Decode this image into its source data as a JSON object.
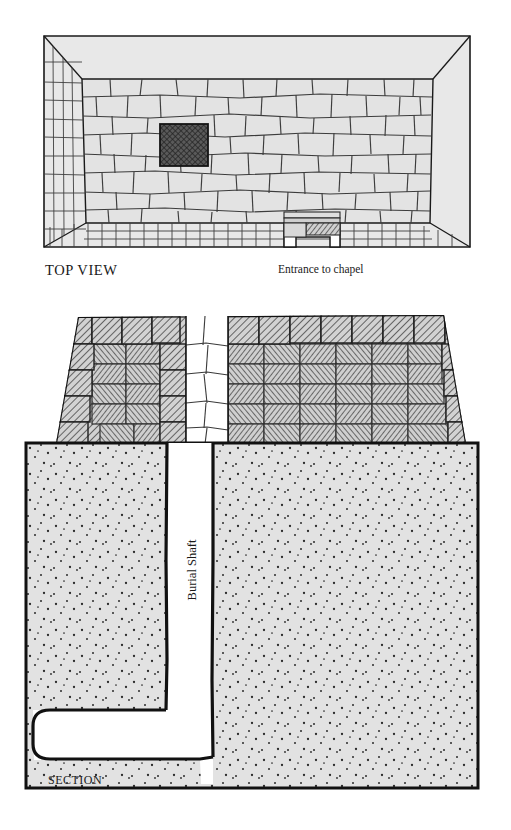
{
  "figure": {
    "kind": "archaeological-diagram",
    "panels": [
      {
        "id": "top-view",
        "label": "TOP VIEW"
      },
      {
        "id": "section",
        "label": "SECTION"
      }
    ]
  },
  "labels": {
    "top_view": "TOP VIEW",
    "entrance_to_chapel": "Entrance to chapel",
    "burial_shaft": "Burial Shaft",
    "section": "SECTION"
  },
  "colors": {
    "paper": "#ffffff",
    "ink": "#1a1a1a",
    "wall_face_fill": "#e8e8e8",
    "stone_fill": "#e3e3e3",
    "stone_stroke": "#4a4a4a",
    "bedrock_fill": "#e2e2e2",
    "bedrock_stipple": "#2b2b2b",
    "shaft_void": "#ffffff",
    "masonry_hatch": "#8a8a8a",
    "shaft_opening_fill": "#555555",
    "outline": "#111111"
  },
  "top_view": {
    "description": "Rectangular mastaba seen from above with sloping outer walls in perspective, stone-paved interior, a dark hatched square marking the burial shaft opening, and a notched entrance in the lower wall.",
    "shaft_opening": {
      "label": "burial shaft opening",
      "fill": "#555555",
      "hatched": true
    },
    "entrance": {
      "label": "Entrance to chapel",
      "position": "lower wall, right of centre"
    },
    "walls": {
      "top": "plain sloped face",
      "right": "plain sloped face",
      "left": "coursed brickwork",
      "bottom": "coursed brickwork"
    }
  },
  "section": {
    "description": "Vertical cross-section: trapezoidal mastaba superstructure of hatched masonry above ground, a vertical burial shaft cut through it and deep into the stippled bedrock, ending in a burial chamber offset to the left at the shaft bottom.",
    "superstructure": {
      "fill": "woven hatched blocks",
      "casing": "uniform diagonal hatch"
    },
    "bedrock": {
      "fill": "stippled light grey"
    },
    "shaft": {
      "label": "Burial Shaft",
      "orientation": "vertical",
      "void": true
    },
    "chamber": {
      "position": "bottom-left of shaft",
      "void": true
    }
  }
}
